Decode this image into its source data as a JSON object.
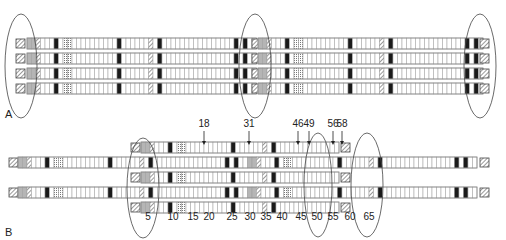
{
  "colors": {
    "outline": "#8a8a8a",
    "cell_line": "#9a9a9a",
    "dark": "#1a1a1a",
    "gray": "#b5b5b5",
    "hatch": "#555555",
    "ellipse": "#444444",
    "text": "#222222"
  },
  "cell_width": 4.5,
  "panel_a": {
    "label": "A",
    "label_pos": [
      5,
      118
    ],
    "rows_y": [
      38,
      53,
      68,
      83
    ],
    "row_height": 11,
    "segments": [
      {
        "x": 27,
        "n_cells": 51,
        "pattern": "repeat"
      },
      {
        "x": 258,
        "n_cells": 50,
        "pattern": "repeat"
      }
    ],
    "left_cap_x": 16,
    "right_cap_x": 480,
    "mid_cap_x": 252,
    "ellipses": [
      {
        "cx": 21,
        "cy": 66,
        "rx": 16,
        "ry": 52
      },
      {
        "cx": 255,
        "cy": 66,
        "rx": 16,
        "ry": 52
      },
      {
        "cx": 480,
        "cy": 66,
        "rx": 16,
        "ry": 52
      }
    ]
  },
  "panel_b": {
    "label": "B",
    "label_pos": [
      5,
      236
    ],
    "row_height": 11,
    "long_rows": {
      "y": [
        157,
        187
      ],
      "x_start": 27,
      "x_end": 487,
      "left_cap_x": 18,
      "right_cap_x": 489,
      "inner_cap_x": 312
    },
    "short_rows": {
      "y": [
        142,
        172,
        202
      ],
      "x_start": 141,
      "x_end": 340,
      "left_cap_x": 131,
      "right_cap_x": 341
    },
    "ellipses": [
      {
        "cx": 143,
        "cy": 188,
        "rx": 16,
        "ry": 50
      },
      {
        "cx": 318,
        "cy": 185,
        "rx": 14,
        "ry": 52
      },
      {
        "cx": 367,
        "cy": 185,
        "rx": 16,
        "ry": 52
      }
    ],
    "tick_labels": [
      {
        "text": "5",
        "x": 148
      },
      {
        "text": "10",
        "x": 173
      },
      {
        "text": "15",
        "x": 193
      },
      {
        "text": "20",
        "x": 209
      },
      {
        "text": "25",
        "x": 232
      },
      {
        "text": "30",
        "x": 250
      },
      {
        "text": "35",
        "x": 266
      },
      {
        "text": "40",
        "x": 282
      },
      {
        "text": "45",
        "x": 301
      },
      {
        "text": "50",
        "x": 317
      },
      {
        "text": "55",
        "x": 333
      },
      {
        "text": "60",
        "x": 350
      },
      {
        "text": "65",
        "x": 369
      }
    ],
    "tick_label_y": 220,
    "arrows": [
      {
        "text": "18",
        "x": 204
      },
      {
        "text": "31",
        "x": 249
      },
      {
        "text": "46",
        "x": 298
      },
      {
        "text": "49",
        "x": 309
      },
      {
        "text": "56",
        "x": 333
      },
      {
        "text": "58",
        "x": 342
      }
    ],
    "arrow_label_y": 127,
    "arrow_top": 131,
    "arrow_bottom": 145
  }
}
